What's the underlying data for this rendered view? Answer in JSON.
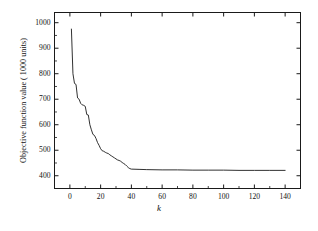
{
  "chart_data": {
    "type": "line",
    "title": "",
    "subtitle": "",
    "xlabel": "k",
    "ylabel": "Objective function value ( 1000 units)",
    "xlim": [
      -10,
      150
    ],
    "ylim": [
      350,
      1040
    ],
    "xticks": [
      0,
      20,
      40,
      60,
      80,
      100,
      120,
      140
    ],
    "yticks": [
      400,
      500,
      600,
      700,
      800,
      900,
      1000
    ],
    "xtick_labels": [
      "0",
      "20",
      "40",
      "60",
      "80",
      "100",
      "120",
      "140"
    ],
    "ytick_labels": [
      "400",
      "500",
      "600",
      "700",
      "800",
      "900",
      "1000"
    ],
    "grid": false,
    "legend": null,
    "legend_position": "none",
    "line_color": "#1a1a1a",
    "line_width": 0.9,
    "frame_color": "#1a1a1a",
    "background": "#ffffff",
    "series": [
      {
        "name": "Objective function value",
        "x": [
          1,
          2,
          3,
          4,
          5,
          6,
          7,
          8,
          9,
          10,
          11,
          12,
          13,
          14,
          15,
          16,
          17,
          18,
          19,
          20,
          21,
          22,
          23,
          24,
          25,
          26,
          27,
          28,
          29,
          30,
          31,
          32,
          33,
          34,
          35,
          36,
          37,
          38,
          39,
          40,
          45,
          50,
          60,
          70,
          80,
          90,
          100,
          110,
          120,
          130,
          140
        ],
        "y": [
          975,
          800,
          762,
          758,
          705,
          700,
          684,
          678,
          676,
          672,
          640,
          638,
          600,
          580,
          562,
          558,
          546,
          530,
          519,
          506,
          498,
          496,
          492,
          489,
          487,
          482,
          478,
          474,
          470,
          466,
          462,
          460,
          457,
          452,
          448,
          444,
          438,
          432,
          428,
          426,
          425,
          424,
          423,
          423,
          422,
          422,
          422,
          421,
          421,
          421,
          421
        ]
      }
    ],
    "annotations": []
  },
  "figure": {
    "axis_title_y": "Objective function value ( 1000 units)",
    "axis_title_x": "k"
  }
}
